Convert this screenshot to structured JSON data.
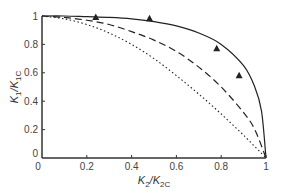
{
  "chart_data": {
    "type": "line",
    "title": "",
    "xlabel": "K2/K2C",
    "ylabel": "K1/K1C",
    "xlim": [
      0,
      1
    ],
    "ylim": [
      0,
      1
    ],
    "grid": false,
    "legend": null,
    "x_ticks": [
      "0",
      "0.2",
      "0.4",
      "0.6",
      "0.8",
      "1"
    ],
    "y_ticks": [
      "0",
      "0.2",
      "0.4",
      "0.6",
      "0.8",
      "1"
    ],
    "series": [
      {
        "name": "solid curve",
        "style": "solid",
        "x": [
          0,
          0.1,
          0.2,
          0.3,
          0.4,
          0.5,
          0.6,
          0.7,
          0.8,
          0.9,
          0.95,
          0.98,
          1.0
        ],
        "y": [
          1.0,
          1.0,
          0.995,
          0.99,
          0.98,
          0.96,
          0.93,
          0.88,
          0.8,
          0.65,
          0.5,
          0.33,
          0.0
        ]
      },
      {
        "name": "dashed curve",
        "style": "dashed",
        "x": [
          0,
          0.1,
          0.2,
          0.3,
          0.4,
          0.5,
          0.6,
          0.7,
          0.8,
          0.9,
          0.95,
          1.0
        ],
        "y": [
          1.0,
          0.99,
          0.97,
          0.94,
          0.89,
          0.83,
          0.75,
          0.64,
          0.5,
          0.32,
          0.2,
          0.0
        ]
      },
      {
        "name": "dotted curve",
        "style": "dotted",
        "x": [
          0,
          0.1,
          0.2,
          0.3,
          0.4,
          0.5,
          0.6,
          0.7,
          0.8,
          0.9,
          1.0
        ],
        "y": [
          1.0,
          0.98,
          0.94,
          0.88,
          0.8,
          0.7,
          0.58,
          0.45,
          0.31,
          0.16,
          0.0
        ]
      },
      {
        "name": "experimental data",
        "style": "markers-triangle",
        "x": [
          0.24,
          0.48,
          0.78,
          0.88
        ],
        "y": [
          0.99,
          0.98,
          0.77,
          0.58
        ]
      }
    ]
  }
}
